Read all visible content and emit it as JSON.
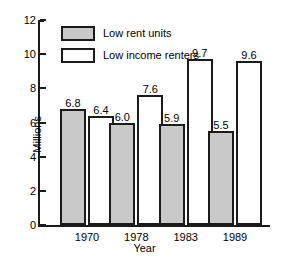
{
  "chart_data": {
    "type": "bar",
    "title": "",
    "xlabel": "Year",
    "ylabel": "Millions",
    "categories": [
      "1970",
      "1978",
      "1983",
      "1989"
    ],
    "series": [
      {
        "name": "Low rent units",
        "values": [
          6.8,
          6.0,
          5.9,
          5.5
        ],
        "color": "#c9c9c9"
      },
      {
        "name": "Low income renters",
        "values": [
          6.4,
          7.6,
          9.7,
          9.6
        ],
        "color": "#ffffff"
      }
    ],
    "ylim": [
      0,
      12
    ],
    "yticks": [
      0,
      2,
      4,
      6,
      8,
      10,
      12
    ],
    "ytick_labels": [
      "0",
      "2",
      "4",
      "6",
      "8",
      "10",
      "12"
    ],
    "grid": false,
    "legend_position": "upper-left-inside",
    "value_labels": [
      [
        "6.8",
        "6.4"
      ],
      [
        "6.0",
        "7.6"
      ],
      [
        "5.9",
        "9.7"
      ],
      [
        "5.5",
        "9.6"
      ]
    ]
  }
}
